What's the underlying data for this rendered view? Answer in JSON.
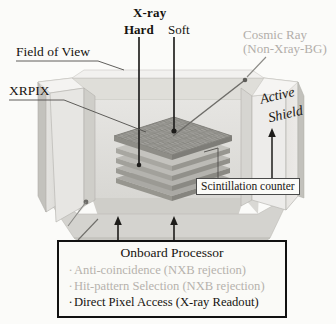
{
  "figure": {
    "title_labels": {
      "xray": "X-ray",
      "hard": "Hard",
      "soft": "Soft",
      "cosmic_ray_line1": "Cosmic Ray",
      "cosmic_ray_line2": "(Non-Xray-BG)",
      "field_of_view": "Field of View",
      "xrpix": "XRPIX",
      "active_shield_line1": "Active",
      "active_shield_line2": "Shield",
      "scintillation_counter": "Scintillation counter"
    },
    "processor_box": {
      "header": "Onboard Processor",
      "items": [
        {
          "bullet": "·",
          "text": "Anti-coincidence (NXB rejection)",
          "muted": true
        },
        {
          "bullet": "·",
          "text": "Hit-pattern Selection (NXB rejection)",
          "muted": true
        },
        {
          "bullet": "·",
          "text": "Direct Pixel Access (X-ray Readout)",
          "muted": false
        }
      ]
    },
    "colors": {
      "background": "#fbfbf9",
      "ink": "#16130f",
      "muted_text": "#b6b2ad",
      "shield_light": "#efeeec",
      "shield_mid": "#dcdbd8",
      "shield_dark": "#c6c5c1",
      "shield_floor": "#d2d1cd",
      "detector_top": "#9f9e99",
      "detector_edge": "#7d7c77",
      "leader_line": "#5e5d59",
      "ray_line": "#2b2a27"
    },
    "icon_names": [
      "xray-hard-ray-line",
      "xray-soft-ray-line",
      "cosmic-ray-line",
      "field-of-view-ellipse",
      "active-shield-box",
      "detector-stack",
      "pixel-array-grid"
    ]
  }
}
